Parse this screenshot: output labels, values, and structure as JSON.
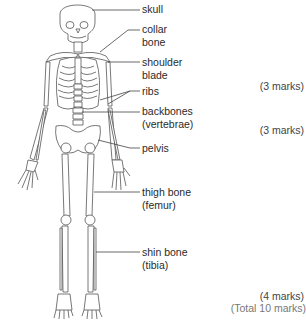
{
  "labels": {
    "skull": [
      "skull"
    ],
    "collar_bone": [
      "collar",
      "bone"
    ],
    "shoulder_blade": [
      "shoulder",
      "blade"
    ],
    "ribs": [
      "ribs"
    ],
    "backbones": [
      "backbones",
      "(vertebrae)"
    ],
    "pelvis": [
      "pelvis"
    ],
    "thigh_bone": [
      "thigh bone",
      "(femur)"
    ],
    "shin_bone": [
      "shin bone",
      "(tibia)"
    ]
  },
  "marks": {
    "m1": "(3 marks)",
    "m2": "(3 marks)",
    "m3": "(4 marks)",
    "total": "(Total 10 marks)"
  },
  "colors": {
    "line": "#555555",
    "bone_fill": "#ffffff",
    "text": "#2a2a2a"
  }
}
